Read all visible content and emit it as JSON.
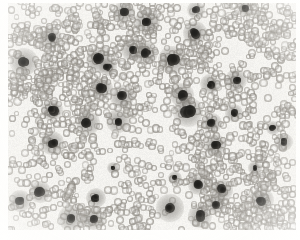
{
  "image": {
    "kind": "light-microscopy-micrograph",
    "title": "Peripheral blood smear micrograph",
    "description": "Dense field of pale gray anucleate round cells with scattered dark-stained nucleated cells",
    "width": 300,
    "height": 240,
    "background_color": "#ffffff"
  },
  "field": {
    "name": "specimen-field",
    "x": 8,
    "y": 3,
    "width": 288,
    "height": 227,
    "background_color": "#f8f7f5"
  },
  "palette": {
    "background": "#f8f7f5",
    "paper_white": "#ffffff",
    "cell_gray": "#968f88",
    "cell_gray_light": "#b4afa8",
    "nucleus_dark": "#151413",
    "nucleus_mid": "#2b2926",
    "halo_gray": "#6e6b66"
  },
  "cell_style": {
    "rbc_diameter_min": 5.4,
    "rbc_diameter_max": 8.6,
    "wbc_core_min": 5.5,
    "wbc_core_max": 10.5,
    "wbc_halo_scale": 2.6
  },
  "generation": {
    "rbc_count": 1650,
    "seed": 20240917,
    "cluster_seed": 777,
    "cluster_count": 120,
    "cluster_members_min": 5,
    "cluster_members_max": 22,
    "cluster_spread": 17,
    "scatter_count": 300
  },
  "nucleated_cells": [
    {
      "x": 124,
      "y": 12,
      "r": 4.2
    },
    {
      "x": 196,
      "y": 10,
      "r": 3.6
    },
    {
      "x": 245,
      "y": 8,
      "r": 3.2
    },
    {
      "x": 147,
      "y": 22,
      "r": 5.0
    },
    {
      "x": 51,
      "y": 38,
      "r": 4.3
    },
    {
      "x": 195,
      "y": 33,
      "r": 4.6
    },
    {
      "x": 132,
      "y": 50,
      "r": 4.3
    },
    {
      "x": 146,
      "y": 53,
      "r": 4.6
    },
    {
      "x": 172,
      "y": 60,
      "r": 5.2
    },
    {
      "x": 24,
      "y": 62,
      "r": 5.4
    },
    {
      "x": 99,
      "y": 60,
      "r": 5.0
    },
    {
      "x": 108,
      "y": 67,
      "r": 3.4
    },
    {
      "x": 236,
      "y": 80,
      "r": 4.4
    },
    {
      "x": 210,
      "y": 84,
      "r": 4.0
    },
    {
      "x": 102,
      "y": 88,
      "r": 4.4
    },
    {
      "x": 182,
      "y": 95,
      "r": 4.6
    },
    {
      "x": 122,
      "y": 97,
      "r": 4.6
    },
    {
      "x": 52,
      "y": 110,
      "r": 4.4
    },
    {
      "x": 188,
      "y": 112,
      "r": 5.6
    },
    {
      "x": 234,
      "y": 113,
      "r": 3.4
    },
    {
      "x": 88,
      "y": 123,
      "r": 4.8
    },
    {
      "x": 118,
      "y": 121,
      "r": 4.6
    },
    {
      "x": 212,
      "y": 123,
      "r": 3.8
    },
    {
      "x": 52,
      "y": 143,
      "r": 4.6
    },
    {
      "x": 215,
      "y": 145,
      "r": 4.2
    },
    {
      "x": 284,
      "y": 142,
      "r": 3.6
    },
    {
      "x": 273,
      "y": 128,
      "r": 2.8
    },
    {
      "x": 198,
      "y": 185,
      "r": 4.0
    },
    {
      "x": 222,
      "y": 190,
      "r": 4.4
    },
    {
      "x": 40,
      "y": 192,
      "r": 4.2
    },
    {
      "x": 20,
      "y": 201,
      "r": 4.4
    },
    {
      "x": 96,
      "y": 198,
      "r": 3.8
    },
    {
      "x": 216,
      "y": 204,
      "r": 4.0
    },
    {
      "x": 262,
      "y": 200,
      "r": 4.6
    },
    {
      "x": 170,
      "y": 208,
      "r": 5.2
    },
    {
      "x": 200,
      "y": 216,
      "r": 4.6
    },
    {
      "x": 71,
      "y": 218,
      "r": 5.0
    },
    {
      "x": 93,
      "y": 219,
      "r": 4.2
    },
    {
      "x": 255,
      "y": 168,
      "r": 2.6
    },
    {
      "x": 175,
      "y": 178,
      "r": 2.8
    },
    {
      "x": 113,
      "y": 168,
      "r": 2.4
    }
  ],
  "spindle_cell": {
    "x": 66,
    "y": 180,
    "width": 7,
    "height": 21,
    "rotation_deg": 22
  }
}
